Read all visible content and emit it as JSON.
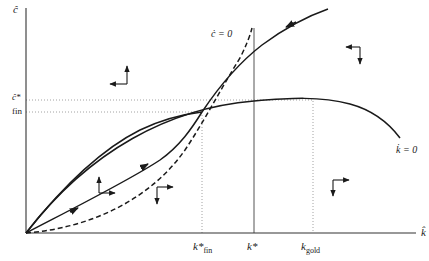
{
  "diagram": {
    "title": "",
    "axes": {
      "y_label": "ĉ",
      "x_label": "k̂"
    },
    "y_ticks": [
      {
        "label": "ĉ*",
        "text": "c*"
      },
      {
        "label": "fin",
        "text": "fin"
      }
    ],
    "x_ticks": [
      {
        "label": "k̂*fin",
        "base": "k*",
        "sub": "fin"
      },
      {
        "label": "k̂*",
        "base": "k*",
        "sub": ""
      },
      {
        "label": "k̂gold",
        "base": "k",
        "sub": "gold"
      }
    ],
    "curves": [
      {
        "name": "c-dot-zero",
        "label": "ċ = 0",
        "style": "dashed"
      },
      {
        "name": "k-dot-zero",
        "label": "k̇ = 0",
        "style": "solid"
      },
      {
        "name": "saddle-path-upper",
        "label": "",
        "style": "solid",
        "arrows": "toward-steady-state"
      },
      {
        "name": "transition-path-lower",
        "label": "",
        "style": "solid",
        "arrows": "toward-steady-state"
      }
    ],
    "curve_labels": {
      "c_dot": "ċ = 0",
      "k_dot": "k̇ = 0"
    },
    "vertical_lines": [
      {
        "name": "k-star-fin",
        "style": "dotted"
      },
      {
        "name": "k-star",
        "style": "solid"
      },
      {
        "name": "k-gold",
        "style": "dotted"
      }
    ],
    "horizontal_lines": [
      {
        "name": "c-star",
        "style": "dotted"
      },
      {
        "name": "c-fin",
        "style": "dotted"
      }
    ],
    "direction_arrows": [
      {
        "region": "upper-left",
        "directions": [
          "up",
          "left"
        ]
      },
      {
        "region": "upper-right",
        "directions": [
          "left",
          "down"
        ]
      },
      {
        "region": "lower-left-between",
        "directions": [
          "up",
          "right"
        ]
      },
      {
        "region": "lower-middle",
        "directions": [
          "right",
          "down"
        ]
      },
      {
        "region": "lower-right",
        "directions": [
          "right",
          "down"
        ]
      }
    ],
    "colors": {
      "line": "#1a1a1a",
      "dotted": "#888888",
      "background": "#ffffff"
    }
  }
}
